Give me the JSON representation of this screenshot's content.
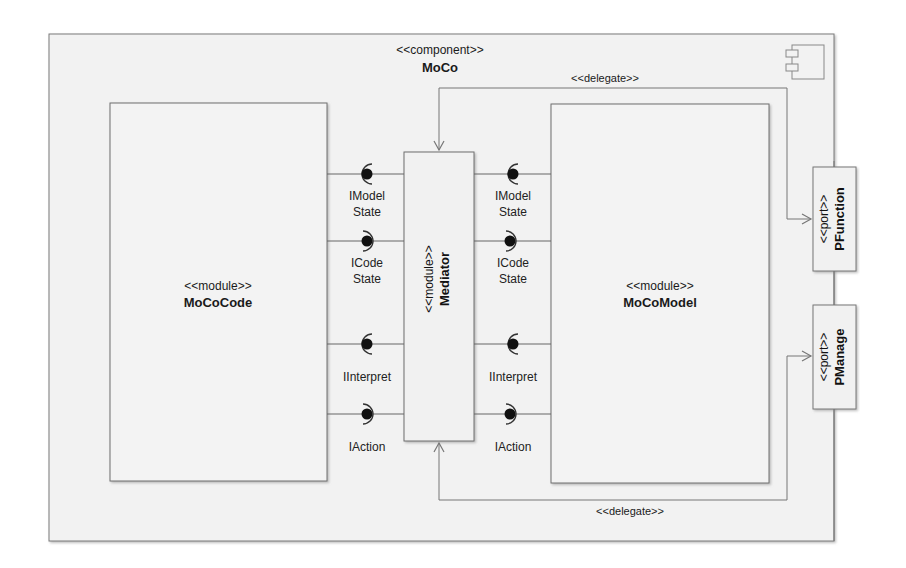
{
  "diagram": {
    "type": "UML component diagram",
    "component": {
      "stereotype": "<<component>>",
      "name": "MoCo",
      "icon": "component-icon"
    },
    "modules": [
      {
        "id": "moco-code",
        "stereotype": "<<module>>",
        "name": "MoCoCode"
      },
      {
        "id": "mediator",
        "stereotype": "<<module>>",
        "name": "Mediator"
      },
      {
        "id": "moco-model",
        "stereotype": "<<module>>",
        "name": "MoCoModel"
      }
    ],
    "ports": [
      {
        "id": "pfunction",
        "stereotype": "<<port>>",
        "name": "PFunction"
      },
      {
        "id": "pmanage",
        "stereotype": "<<port>>",
        "name": "PManage"
      }
    ],
    "left_interfaces": [
      {
        "line1": "IModel",
        "line2": "State",
        "kind": "required"
      },
      {
        "line1": "ICode",
        "line2": "State",
        "kind": "provided"
      },
      {
        "line1": "IInterpret",
        "line2": "",
        "kind": "required"
      },
      {
        "line1": "IAction",
        "line2": "",
        "kind": "provided"
      }
    ],
    "right_interfaces": [
      {
        "line1": "IModel",
        "line2": "State",
        "kind": "required"
      },
      {
        "line1": "ICode",
        "line2": "State",
        "kind": "provided"
      },
      {
        "line1": "IInterpret",
        "line2": "",
        "kind": "required"
      },
      {
        "line1": "IAction",
        "line2": "",
        "kind": "provided"
      }
    ],
    "delegates": [
      {
        "label": "<<delegate>>",
        "from": "PFunction",
        "to": "Mediator",
        "position": "top"
      },
      {
        "label": "<<delegate>>",
        "from": "PManage",
        "to": "Mediator",
        "position": "bottom"
      }
    ]
  },
  "background_text": {
    "lines": [
      "…components are introduced. A component …",
      "…a CodeCoordinator…, …MoCoCode … coordin…",
      "…from these …, the Mediator … the Mediator …",
      "…MoCoModel. … the … of …",
      "…process … (…) … … [10] … …",
      "…once they … module … …",
      "…in … two … the MoCoModel …",
      "…relevant … function … … …",
      "…",
      "MoCoCode Module"
    ]
  }
}
